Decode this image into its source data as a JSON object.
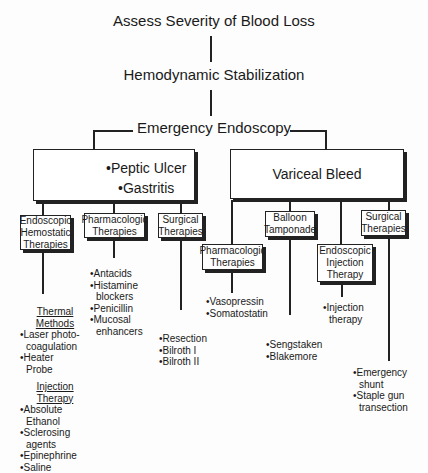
{
  "title": "Assess Severity of Blood Loss",
  "step2": "Hemodynamic Stabilization",
  "step3": "Emergency Endoscopy",
  "left_branch": {
    "items": [
      "•Peptic Ulcer",
      "•Gastritis"
    ],
    "therapies": [
      {
        "label_lines": [
          "Endoscopic",
          "Hemostatic",
          "Therapies"
        ]
      },
      {
        "label_lines": [
          "Pharmacologic",
          "Therapies"
        ]
      },
      {
        "label_lines": [
          "Surgical",
          "Therapies"
        ]
      }
    ],
    "endoscopic": {
      "thermal_heading": [
        "Thermal",
        "Methods"
      ],
      "thermal_items": [
        "•Laser photo-",
        "coagulation",
        "•Heater",
        "Probe"
      ],
      "injection_heading": [
        "Injection",
        "Therapy"
      ],
      "injection_items": [
        "•Absolute",
        "Ethanol",
        "•Sclerosing",
        "agents",
        "•Epinephrine",
        "•Saline"
      ]
    },
    "pharmacologic_items": [
      "•Antacids",
      "•Histamine",
      "blockers",
      "•Penicillin",
      "•Mucosal",
      "enhancers"
    ],
    "surgical_items": [
      "•Resection",
      "•Bilroth I",
      "•Bilroth II"
    ]
  },
  "right_branch": {
    "label": "Variceal Bleed",
    "therapies": [
      {
        "label_lines": [
          "Pharmacologic",
          "Therapies"
        ]
      },
      {
        "label_lines": [
          "Balloon",
          "Tamponade"
        ]
      },
      {
        "label_lines": [
          "Endoscopic",
          "Injection",
          "Therapy"
        ]
      },
      {
        "label_lines": [
          "Surgical",
          "Therapies"
        ]
      }
    ],
    "pharmacologic_items": [
      "•Vasopressin",
      "•Somatostatin"
    ],
    "balloon_items": [
      "•Sengstaken",
      "•Blakemore"
    ],
    "injection_items": [
      "•Injection",
      "therapy"
    ],
    "surgical_items": [
      "•Emergency",
      "shunt",
      "•Staple gun",
      "transection"
    ]
  }
}
